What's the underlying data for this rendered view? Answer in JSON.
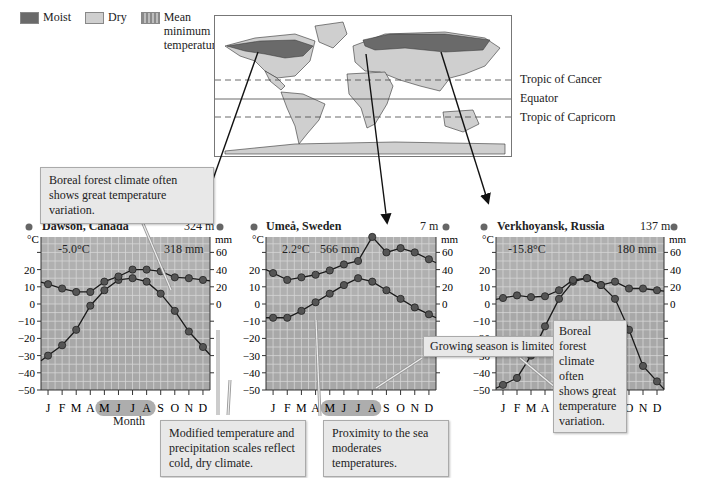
{
  "legend": {
    "moist": {
      "label": "Moist",
      "color": "#6a6a6a"
    },
    "dry": {
      "label": "Dry",
      "color": "#cfcfcf"
    },
    "mean": {
      "label_line1": "Mean",
      "label_line2": "minimum",
      "label_line3": "temperature >0°C",
      "color": "#a9a9a9"
    }
  },
  "map": {
    "labels": {
      "cancer": "Tropic of Cancer",
      "equator": "Equator",
      "capricorn": "Tropic of Capricorn"
    }
  },
  "callouts": {
    "boreal_top": "Boreal forest climate often shows great temperature variation.",
    "modified_scales": "Modified temperature and precipitation scales reflect cold, dry climate.",
    "proximity_sea": "Proximity to the sea moderates temperatures.",
    "growing_season": "Growing season is limited.",
    "boreal_right_1": "Boreal forest",
    "boreal_right_2": "climate often",
    "boreal_right_3": "shows great",
    "boreal_right_4": "temperature",
    "boreal_right_5": "variation."
  },
  "axis": {
    "temp_unit": "°C",
    "precip_unit": "mm",
    "month_label": "Month"
  },
  "chart_data": [
    {
      "type": "line",
      "title": "Dawson, Canada",
      "elevation": "324 m",
      "mean_temp": "-5.0°C",
      "annual_precip": "318 mm",
      "xlabel": "Month",
      "ylabel_left": "°C",
      "ylabel_right": "mm",
      "categories": [
        "J",
        "F",
        "M",
        "A",
        "M",
        "J",
        "J",
        "A",
        "S",
        "O",
        "N",
        "D"
      ],
      "highlighted_months": [
        "M",
        "J",
        "J",
        "A"
      ],
      "left_ticks": [
        20,
        10,
        0,
        -10,
        -20,
        -30,
        -40,
        -50
      ],
      "right_ticks": [
        60,
        40,
        20,
        0
      ],
      "ylim_temp": [
        -50,
        40
      ],
      "series": [
        {
          "name": "Temperature (°C)",
          "axis": "left",
          "values": [
            -30,
            -24,
            -15,
            -1,
            8,
            14,
            15,
            13,
            6,
            -4,
            -16,
            -25
          ]
        },
        {
          "name": "Precipitation (mm)",
          "axis": "right",
          "values": [
            23,
            18,
            14,
            14,
            26,
            32,
            40,
            40,
            38,
            31,
            30,
            28
          ]
        }
      ]
    },
    {
      "type": "line",
      "title": "Umeå, Sweden",
      "elevation": "7 m",
      "mean_temp": "2.2°C",
      "annual_precip": "566 mm",
      "xlabel": "",
      "ylabel_left": "°C",
      "ylabel_right": "mm",
      "categories": [
        "J",
        "F",
        "M",
        "A",
        "M",
        "J",
        "J",
        "A",
        "S",
        "O",
        "N",
        "D"
      ],
      "highlighted_months": [
        "M",
        "J",
        "J",
        "A"
      ],
      "left_ticks": [
        20,
        10,
        0,
        -10,
        -20,
        -30,
        -40,
        -50
      ],
      "right_ticks": [
        60,
        40,
        20,
        0
      ],
      "ylim_temp": [
        -50,
        40
      ],
      "series": [
        {
          "name": "Temperature (°C)",
          "axis": "left",
          "values": [
            -8,
            -8,
            -4,
            1,
            6,
            11,
            15,
            13,
            8,
            3,
            -2,
            -6
          ]
        },
        {
          "name": "Precipitation (mm)",
          "axis": "right",
          "values": [
            36,
            28,
            31,
            34,
            39,
            46,
            50,
            78,
            60,
            65,
            60,
            52
          ]
        }
      ]
    },
    {
      "type": "line",
      "title": "Verkhoyansk, Russia",
      "elevation": "137 m",
      "mean_temp": "-15.8°C",
      "annual_precip": "180 mm",
      "xlabel": "",
      "ylabel_left": "°C",
      "ylabel_right": "mm",
      "categories": [
        "J",
        "F",
        "M",
        "A",
        "M",
        "J",
        "J",
        "A",
        "S",
        "O",
        "N",
        "D"
      ],
      "highlighted_months": [
        "J",
        "J",
        "A"
      ],
      "left_ticks": [
        20,
        10,
        0,
        -10,
        -20,
        -30,
        -40,
        -50
      ],
      "right_ticks": [
        60,
        40,
        20,
        0
      ],
      "ylim_temp": [
        -50,
        40
      ],
      "series": [
        {
          "name": "Temperature (°C)",
          "axis": "left",
          "values": [
            -47,
            -43,
            -30,
            -13,
            3,
            13,
            15,
            11,
            3,
            -15,
            -36,
            -45
          ]
        },
        {
          "name": "Precipitation (mm)",
          "axis": "right",
          "values": [
            7,
            10,
            8,
            9,
            16,
            28,
            30,
            22,
            26,
            18,
            18,
            16
          ]
        }
      ]
    }
  ]
}
